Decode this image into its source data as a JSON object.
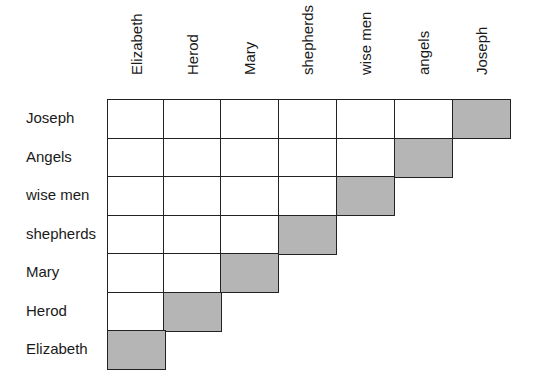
{
  "columns": [
    "Elizabeth",
    "Herod",
    "Mary",
    "shepherds",
    "wise men",
    "angels",
    "Joseph"
  ],
  "rows": [
    "Joseph",
    "Angels",
    "wise men",
    "shepherds",
    "Mary",
    "Herod",
    "Elizabeth"
  ],
  "colors": {
    "shaded": "#b5b5b5",
    "empty": "#ffffff",
    "grid": "#222222"
  },
  "grid": {
    "description": "Triangular comparison grid; row i has (7 - i) cells, the last cell of each row (diagonal, same person) is shaded gray",
    "cells": [
      [
        0,
        0,
        0,
        0,
        0,
        0,
        1
      ],
      [
        0,
        0,
        0,
        0,
        0,
        1
      ],
      [
        0,
        0,
        0,
        0,
        1
      ],
      [
        0,
        0,
        0,
        1
      ],
      [
        0,
        0,
        1
      ],
      [
        0,
        1
      ],
      [
        1
      ]
    ]
  }
}
